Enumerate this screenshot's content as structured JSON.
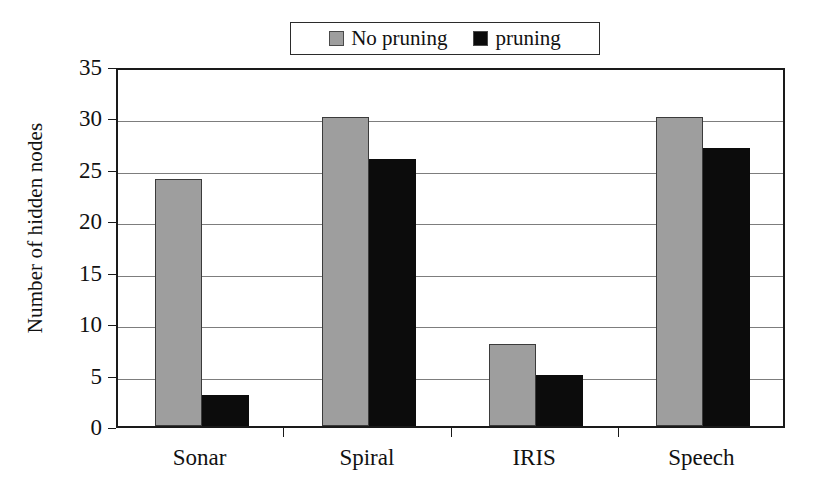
{
  "chart_data": {
    "type": "bar",
    "title": "",
    "xlabel": "",
    "ylabel": "Number of hidden nodes",
    "categories": [
      "Sonar",
      "Spiral",
      "IRIS",
      "Speech"
    ],
    "series": [
      {
        "name": "No pruning",
        "color": "#9e9e9e",
        "values": [
          24,
          30,
          8,
          30
        ]
      },
      {
        "name": "pruning",
        "color": "#0c0c0c",
        "values": [
          3,
          26,
          5,
          27
        ]
      }
    ],
    "ylim": [
      0,
      35
    ],
    "ytick_step": 5,
    "yticks": [
      0,
      5,
      10,
      15,
      20,
      25,
      30,
      35
    ],
    "ytick_labels": [
      "0",
      "5",
      "10",
      "15",
      "20",
      "25",
      "30",
      "35"
    ],
    "grid": true,
    "grid_axis": "y",
    "legend_position": "top-center",
    "legend_boxed": true,
    "background": "#ffffff",
    "axis_color": "#1a1a1a",
    "gridline_color": "#7d7d7d"
  },
  "legend": {
    "entries": [
      {
        "label": "No pruning",
        "swatch": "legend-swatch-no-pruning",
        "color": "#9e9e9e"
      },
      {
        "label": "pruning",
        "swatch": "legend-swatch-pruning",
        "color": "#0c0c0c"
      }
    ]
  }
}
